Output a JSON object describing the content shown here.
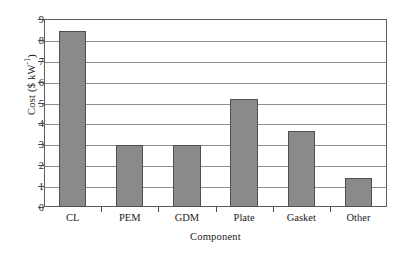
{
  "chart_data": {
    "type": "bar",
    "title": "",
    "xlabel": "Component",
    "ylabel": "Cost ($ kW",
    "ylabel_exponent": "-1",
    "ylabel_suffix": ")",
    "categories": [
      "CL",
      "PEM",
      "GDM",
      "Plate",
      "Gasket",
      "Other"
    ],
    "values": [
      8.45,
      2.98,
      2.95,
      5.15,
      3.65,
      1.4
    ],
    "ylim": [
      0,
      9
    ],
    "ytick_values": [
      9,
      8,
      7,
      6,
      5,
      4,
      3,
      2,
      1,
      0
    ],
    "ytick_labels": [
      "9",
      "8",
      "7",
      "6",
      "5",
      "4",
      "3",
      "2",
      "1",
      "0"
    ],
    "grid": true,
    "grid_axis": "y",
    "legend": false,
    "bar_color": "#8a8a8a",
    "bar_edge_color": "#4f4f4f",
    "axis_color": "#5d5d5d",
    "grid_color": "#8e8e8e",
    "background_color": "#ffffff"
  }
}
